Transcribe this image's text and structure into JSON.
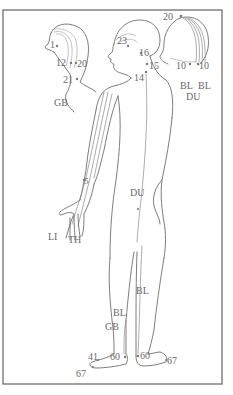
{
  "diagram": {
    "colors": {
      "line": "#6e6e6e",
      "frame": "#7a7a7a",
      "label": "#6a6a6a",
      "background": "#ffffff"
    },
    "head_side_small": {
      "labels": {
        "p1": "1",
        "p12": "12",
        "p20": "20",
        "p21": "21",
        "meridian": "GB"
      }
    },
    "head_main": {
      "labels": {
        "p23": "23",
        "p16": "16",
        "p15": "15",
        "p14": "14"
      }
    },
    "head_back": {
      "labels": {
        "p20": "20",
        "p10a": "10",
        "p10b": "10",
        "meridian_bl_left": "BL",
        "meridian_bl_right": "BL",
        "meridian_du": "DU"
      }
    },
    "arm": {
      "labels": {
        "p5": "5",
        "meridian_li": "LI",
        "meridian_th": "TH"
      }
    },
    "torso": {
      "labels": {
        "meridian_du": "DU"
      }
    },
    "legs": {
      "labels": {
        "meridian_bl_right": "BL",
        "meridian_bl_left": "BL",
        "meridian_gb": "GB",
        "p41": "41",
        "p60_left": "60",
        "p60_right": "60",
        "p67_left": "67",
        "p67_right": "67"
      }
    }
  }
}
